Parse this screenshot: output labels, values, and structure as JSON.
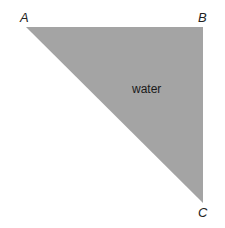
{
  "diagram": {
    "shape": "right-triangle",
    "fill_color": "#a4a4a4",
    "vertices": {
      "A": {
        "label": "A",
        "x": 26,
        "y": 27
      },
      "B": {
        "label": "B",
        "x": 203,
        "y": 27
      },
      "C": {
        "label": "C",
        "x": 203,
        "y": 203
      }
    },
    "region_label": "water"
  }
}
